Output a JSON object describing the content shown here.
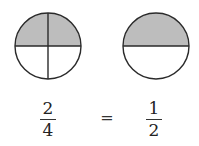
{
  "diagram": {
    "left_circle": {
      "parts": 4,
      "shaded": 2,
      "cx": 48,
      "cy": 46,
      "r": 33
    },
    "right_circle": {
      "parts": 2,
      "shaded": 1,
      "cx": 156,
      "cy": 46,
      "r": 33
    },
    "colors": {
      "shade": "#bdbdbd",
      "stroke": "#2a2a2a"
    },
    "left_fraction": {
      "numerator": "2",
      "denominator": "4"
    },
    "equals": "=",
    "right_fraction": {
      "numerator": "1",
      "denominator": "2"
    }
  }
}
